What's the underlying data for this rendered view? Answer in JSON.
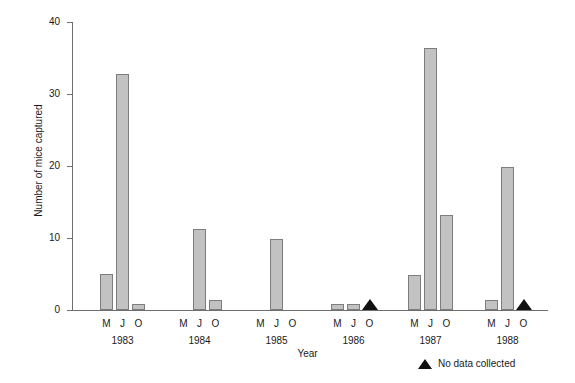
{
  "chart_data": {
    "type": "bar",
    "title": "",
    "xlabel": "Year",
    "ylabel": "Number of mice captured",
    "ylim": [
      0,
      40
    ],
    "yticks": [
      0,
      10,
      20,
      30,
      40
    ],
    "ytick_labels": [
      "0",
      "10",
      "20",
      "30",
      "40"
    ],
    "grid": false,
    "legend_position": "bottom-right",
    "months": [
      "M",
      "J",
      "O"
    ],
    "years": [
      "1983",
      "1984",
      "1985",
      "1986",
      "1987",
      "1988"
    ],
    "categories": [
      "1983 M",
      "1983 J",
      "1983 O",
      "1984 M",
      "1984 J",
      "1984 O",
      "1985 M",
      "1985 J",
      "1985 O",
      "1986 M",
      "1986 J",
      "1986 O",
      "1987 M",
      "1987 J",
      "1987 O",
      "1988 M",
      "1988 J",
      "1988 O"
    ],
    "values": [
      5.0,
      32.8,
      0.8,
      0.0,
      11.2,
      1.4,
      0.0,
      9.9,
      0.0,
      0.8,
      0.8,
      null,
      4.8,
      36.4,
      13.2,
      1.4,
      19.8,
      null
    ],
    "no_data_points": [
      "1986 O",
      "1988 O"
    ],
    "bar_fill_color": "#c2c2c2",
    "bar_edge_color": "#7d7d7d",
    "axis_color": "#6e6e6e",
    "marker_color": "#111111",
    "legend": [
      {
        "marker": "triangle",
        "label": "No data collected"
      }
    ]
  },
  "axes": {
    "y_title": "Number of mice captured",
    "x_title": "Year",
    "y_ticks": [
      {
        "value": 40,
        "label": "40"
      },
      {
        "value": 30,
        "label": "30"
      },
      {
        "value": 20,
        "label": "20"
      },
      {
        "value": 10,
        "label": "10"
      },
      {
        "value": 0,
        "label": "0"
      }
    ]
  },
  "groups": [
    {
      "year": "1983",
      "bars": [
        {
          "month": "M",
          "value": 5.0,
          "no_data": false
        },
        {
          "month": "J",
          "value": 32.8,
          "no_data": false
        },
        {
          "month": "O",
          "value": 0.8,
          "no_data": false
        }
      ]
    },
    {
      "year": "1984",
      "bars": [
        {
          "month": "M",
          "value": 0.0,
          "no_data": false
        },
        {
          "month": "J",
          "value": 11.2,
          "no_data": false
        },
        {
          "month": "O",
          "value": 1.4,
          "no_data": false
        }
      ]
    },
    {
      "year": "1985",
      "bars": [
        {
          "month": "M",
          "value": 0.0,
          "no_data": false
        },
        {
          "month": "J",
          "value": 9.9,
          "no_data": false
        },
        {
          "month": "O",
          "value": 0.0,
          "no_data": false
        }
      ]
    },
    {
      "year": "1986",
      "bars": [
        {
          "month": "M",
          "value": 0.8,
          "no_data": false
        },
        {
          "month": "J",
          "value": 0.8,
          "no_data": false
        },
        {
          "month": "O",
          "value": null,
          "no_data": true
        }
      ]
    },
    {
      "year": "1987",
      "bars": [
        {
          "month": "M",
          "value": 4.8,
          "no_data": false
        },
        {
          "month": "J",
          "value": 36.4,
          "no_data": false
        },
        {
          "month": "O",
          "value": 13.2,
          "no_data": false
        }
      ]
    },
    {
      "year": "1988",
      "bars": [
        {
          "month": "M",
          "value": 1.4,
          "no_data": false
        },
        {
          "month": "J",
          "value": 19.8,
          "no_data": false
        },
        {
          "month": "O",
          "value": null,
          "no_data": true
        }
      ]
    }
  ],
  "legend": {
    "marker_label": "No data collected"
  }
}
